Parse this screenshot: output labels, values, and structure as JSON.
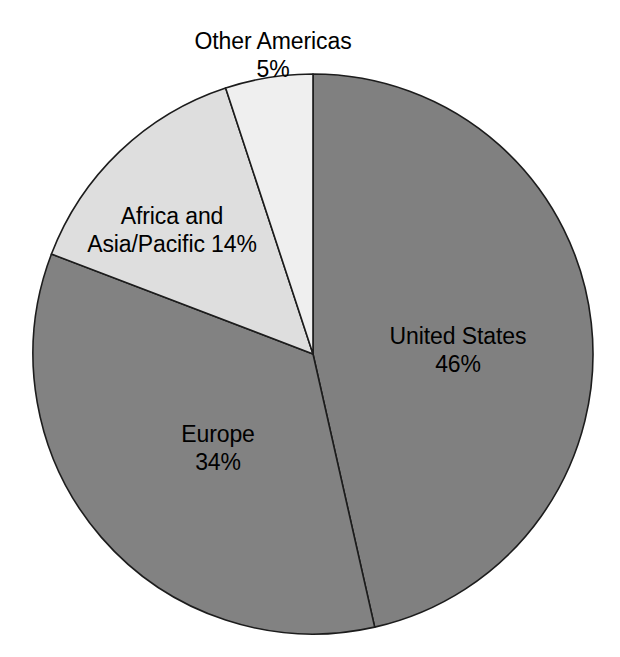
{
  "chart_data": {
    "type": "pie",
    "title": "",
    "subtitle": "",
    "xlabel": "",
    "ylabel": "",
    "legend_position": "none",
    "grid": false,
    "start_angle_deg": 0,
    "direction": "clockwise",
    "categories": [
      "United States",
      "Europe",
      "Africa and Asia/Pacific",
      "Other Americas"
    ],
    "values": [
      46,
      34,
      14,
      5
    ],
    "value_unit": "%",
    "slices": [
      {
        "name": "United States",
        "label_line1": "United States",
        "label_line2": "46%",
        "value": 46,
        "value_text": "46%",
        "color": "#808080",
        "label_placement": "inside"
      },
      {
        "name": "Europe",
        "label_line1": "Europe",
        "label_line2": "34%",
        "value": 34,
        "value_text": "34%",
        "color": "#828282",
        "label_placement": "inside"
      },
      {
        "name": "Africa and Asia/Pacific",
        "label_line1": "Africa and",
        "label_line2": "Asia/Pacific 14%",
        "value": 14,
        "value_text": "14%",
        "color": "#dedede",
        "label_placement": "inside"
      },
      {
        "name": "Other Americas",
        "label_line1": "Other Americas",
        "label_line2": "5%",
        "value": 5,
        "value_text": "5%",
        "color": "#efefef",
        "label_placement": "outside-top"
      }
    ],
    "outline_color": "#1c1c1c",
    "background_color": "#ffffff",
    "text_color": "#000000"
  }
}
